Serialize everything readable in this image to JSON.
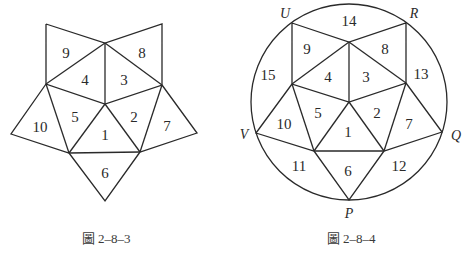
{
  "figures": [
    {
      "caption": "圖 2–8–3",
      "regions": [
        {
          "label": "1",
          "x": 105,
          "y": 135
        },
        {
          "label": "2",
          "x": 134,
          "y": 117
        },
        {
          "label": "3",
          "x": 124,
          "y": 80
        },
        {
          "label": "4",
          "x": 85,
          "y": 80
        },
        {
          "label": "5",
          "x": 75,
          "y": 117
        },
        {
          "label": "6",
          "x": 105,
          "y": 173
        },
        {
          "label": "7",
          "x": 167,
          "y": 126
        },
        {
          "label": "8",
          "x": 142,
          "y": 53
        },
        {
          "label": "9",
          "x": 66,
          "y": 53
        },
        {
          "label": "10",
          "x": 40,
          "y": 127
        }
      ]
    },
    {
      "caption": "圖 2–8–4",
      "regions": [
        {
          "label": "1",
          "x": 348,
          "y": 132
        },
        {
          "label": "2",
          "x": 377,
          "y": 113
        },
        {
          "label": "3",
          "x": 366,
          "y": 77
        },
        {
          "label": "4",
          "x": 328,
          "y": 77
        },
        {
          "label": "5",
          "x": 318,
          "y": 113
        },
        {
          "label": "6",
          "x": 348,
          "y": 171
        },
        {
          "label": "7",
          "x": 409,
          "y": 124
        },
        {
          "label": "8",
          "x": 385,
          "y": 49
        },
        {
          "label": "9",
          "x": 307,
          "y": 49
        },
        {
          "label": "10",
          "x": 284,
          "y": 124
        },
        {
          "label": "11",
          "x": 299,
          "y": 166
        },
        {
          "label": "12",
          "x": 399,
          "y": 166
        },
        {
          "label": "13",
          "x": 421,
          "y": 74
        },
        {
          "label": "14",
          "x": 349,
          "y": 21
        },
        {
          "label": "15",
          "x": 268,
          "y": 75
        }
      ],
      "vertices": [
        {
          "label": "U",
          "x": 285,
          "y": 13
        },
        {
          "label": "R",
          "x": 414,
          "y": 13
        },
        {
          "label": "V",
          "x": 244,
          "y": 134
        },
        {
          "label": "Q",
          "x": 456,
          "y": 135
        },
        {
          "label": "P",
          "x": 349,
          "y": 213
        }
      ]
    }
  ]
}
